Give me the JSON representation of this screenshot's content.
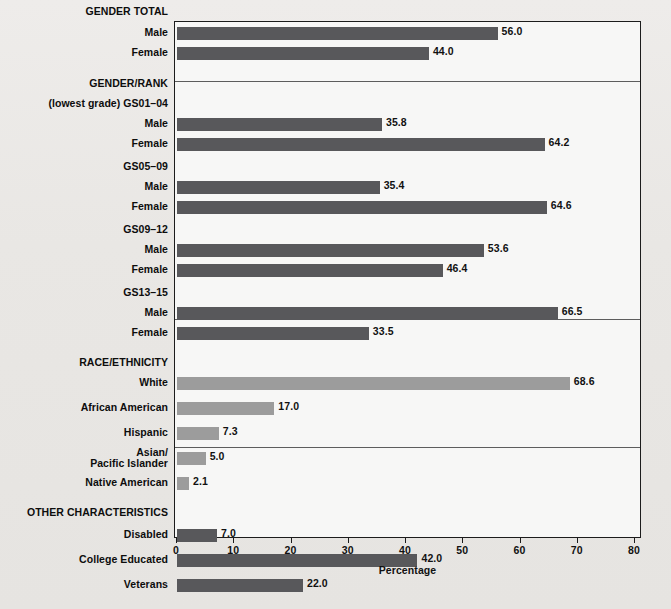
{
  "chart_data": {
    "type": "bar",
    "orientation": "horizontal",
    "title": "",
    "xlabel": "Percentage",
    "ylabel": "",
    "xlim": [
      0,
      80
    ],
    "xticks": [
      "0",
      "10",
      "20",
      "30",
      "40",
      "50",
      "60",
      "70",
      "80"
    ],
    "grid": false,
    "legend": "none",
    "colors": {
      "dark_bar": "#58585b",
      "light_bar": "#9c9c9c",
      "plot_background": "#f7f7f6",
      "page_background": "#eceae7",
      "frame": "#1c1c1c"
    },
    "sections": [
      {
        "heading": "GENDER TOTAL",
        "bar_style": "dark",
        "categories": [
          "Male",
          "Female"
        ],
        "values": [
          56.0,
          44.0
        ],
        "labels": [
          "56.0",
          "44.0"
        ]
      },
      {
        "heading": "GENDER/RANK",
        "bar_style": "dark",
        "groups": [
          {
            "group_label": "(lowest grade) GS01–04",
            "categories": [
              "Male",
              "Female"
            ],
            "values": [
              35.8,
              64.2
            ],
            "labels": [
              "35.8",
              "64.2"
            ]
          },
          {
            "group_label": "GS05–09",
            "categories": [
              "Male",
              "Female"
            ],
            "values": [
              35.4,
              64.6
            ],
            "labels": [
              "35.4",
              "64.6"
            ]
          },
          {
            "group_label": "GS09–12",
            "categories": [
              "Male",
              "Female"
            ],
            "values": [
              53.6,
              46.4
            ],
            "labels": [
              "53.6",
              "46.4"
            ]
          },
          {
            "group_label": "GS13–15",
            "categories": [
              "Male",
              "Female"
            ],
            "values": [
              66.5,
              33.5
            ],
            "labels": [
              "66.5",
              "33.5"
            ]
          }
        ]
      },
      {
        "heading": "RACE/ETHNICITY",
        "bar_style": "light",
        "categories": [
          "White",
          "African American",
          "Hispanic",
          "Asian/\nPacific Islander",
          "Native American"
        ],
        "values": [
          68.6,
          17.0,
          7.3,
          5.0,
          2.1
        ],
        "labels": [
          "68.6",
          "17.0",
          "7.3",
          "5.0",
          "2.1"
        ]
      },
      {
        "heading": "OTHER CHARACTERISTICS",
        "bar_style": "dark",
        "categories": [
          "Disabled",
          "College Educated",
          "Veterans"
        ],
        "values": [
          7.0,
          42.0,
          22.0
        ],
        "labels": [
          "7.0",
          "42.0",
          "22.0"
        ]
      }
    ]
  },
  "rows": [
    {
      "kind": "heading",
      "label": "GENDER TOTAL",
      "y": 12
    },
    {
      "kind": "bar",
      "label": "Male",
      "value": 56.0,
      "text": "56.0",
      "style": "dark",
      "y": 33
    },
    {
      "kind": "bar",
      "label": "Female",
      "value": 44.0,
      "text": "44.0",
      "style": "dark",
      "y": 53
    },
    {
      "kind": "heading",
      "label": "GENDER/RANK",
      "y": 84
    },
    {
      "kind": "group",
      "label": "(lowest grade) GS01–04",
      "y": 104
    },
    {
      "kind": "bar",
      "label": "Male",
      "value": 35.8,
      "text": "35.8",
      "style": "dark",
      "y": 124
    },
    {
      "kind": "bar",
      "label": "Female",
      "value": 64.2,
      "text": "64.2",
      "style": "dark",
      "y": 144
    },
    {
      "kind": "group",
      "label": "GS05–09",
      "y": 167
    },
    {
      "kind": "bar",
      "label": "Male",
      "value": 35.4,
      "text": "35.4",
      "style": "dark",
      "y": 187
    },
    {
      "kind": "bar",
      "label": "Female",
      "value": 64.6,
      "text": "64.6",
      "style": "dark",
      "y": 207
    },
    {
      "kind": "group",
      "label": "GS09–12",
      "y": 230
    },
    {
      "kind": "bar",
      "label": "Male",
      "value": 53.6,
      "text": "53.6",
      "style": "dark",
      "y": 250
    },
    {
      "kind": "bar",
      "label": "Female",
      "value": 46.4,
      "text": "46.4",
      "style": "dark",
      "y": 270
    },
    {
      "kind": "group",
      "label": "GS13–15",
      "y": 293
    },
    {
      "kind": "bar",
      "label": "Male",
      "value": 66.5,
      "text": "66.5",
      "style": "dark",
      "y": 313
    },
    {
      "kind": "bar",
      "label": "Female",
      "value": 33.5,
      "text": "33.5",
      "style": "dark",
      "y": 333
    },
    {
      "kind": "heading",
      "label": "RACE/ETHNICITY",
      "y": 363
    },
    {
      "kind": "bar",
      "label": "White",
      "value": 68.6,
      "text": "68.6",
      "style": "light",
      "y": 383
    },
    {
      "kind": "bar",
      "label": "African American",
      "value": 17.0,
      "text": "17.0",
      "style": "light",
      "y": 408
    },
    {
      "kind": "bar",
      "label": "Hispanic",
      "value": 7.3,
      "text": "7.3",
      "style": "light",
      "y": 433
    },
    {
      "kind": "bar",
      "label": "Asian/\nPacific Islander",
      "value": 5.0,
      "text": "5.0",
      "style": "light",
      "y": 458
    },
    {
      "kind": "bar",
      "label": "Native American",
      "value": 2.1,
      "text": "2.1",
      "style": "light",
      "y": 483
    },
    {
      "kind": "heading",
      "label": "OTHER CHARACTERISTICS",
      "y": 513
    },
    {
      "kind": "bar",
      "label": "Disabled",
      "value": 7.0,
      "text": "7.0",
      "style": "dark",
      "y": 535
    },
    {
      "kind": "bar",
      "label": "College Educated",
      "value": 42.0,
      "text": "42.0",
      "style": "dark",
      "y": 560
    },
    {
      "kind": "bar",
      "label": "Veterans",
      "value": 22.0,
      "text": "22.0",
      "style": "dark",
      "y": 585
    }
  ],
  "separators": [
    80,
    318,
    446
  ],
  "axis": {
    "title": "Percentage",
    "ticks": [
      "0",
      "10",
      "20",
      "30",
      "40",
      "50",
      "60",
      "70",
      "80"
    ],
    "min": 0,
    "max": 80
  }
}
